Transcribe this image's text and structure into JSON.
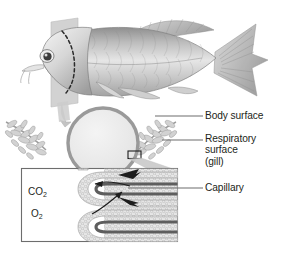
{
  "figure": {
    "background_color": "#ffffff",
    "ink_color": "#231f20"
  },
  "labels": {
    "body_surface": "Body surface",
    "respiratory_surface_line1": "Respiratory",
    "respiratory_surface_line2": "surface",
    "respiratory_surface_line3": "(gill)",
    "capillary": "Capillary"
  },
  "gas_labels": {
    "carbon_dioxide": "CO",
    "carbon_dioxide_sub": "2",
    "oxygen": "O",
    "oxygen_sub": "2"
  },
  "parts": {
    "fish_illustration": "fish-side-view",
    "cutting_plane": "cross-section-plane",
    "gill_cover_outline": "dashed-operculum-arc",
    "cross_section_circle": "body-cross-section",
    "gill_filaments_left": "gill-arch-left",
    "gill_filaments_right": "gill-arch-right",
    "magnify_marker": "magnification-marker-box",
    "inset_panel": "lamellae-detail-inset",
    "lamellae": "gill-lamellae",
    "capillary_vessels": "capillary-loops"
  },
  "colors": {
    "circle_fill": "#ebebeb",
    "circle_ring": "#9a9a9a",
    "plane_fill": "#cfcfcf",
    "tissue_light": "#e3e3e3",
    "tissue_mid": "#b8b8b8",
    "vessel_dark": "#5a5a5a",
    "leader_line": "#6d6d6d",
    "inset_border": "#6d6d6d"
  },
  "leader_lines": [
    {
      "name": "body-surface-leader",
      "x1": 155,
      "y1": 116,
      "x2": 203,
      "y2": 116
    },
    {
      "name": "respiratory-surface-leader",
      "x1": 162,
      "y1": 140,
      "x2": 203,
      "y2": 140
    },
    {
      "name": "capillary-leader",
      "x1": 128,
      "y1": 188,
      "x2": 203,
      "y2": 188
    }
  ]
}
